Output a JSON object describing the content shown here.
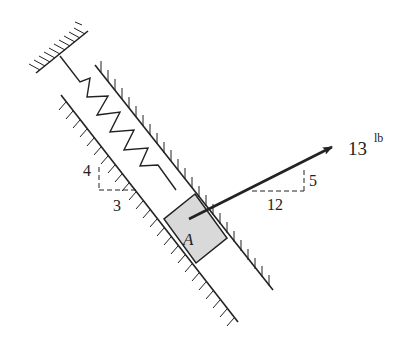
{
  "diagram": {
    "block_label": "A",
    "force": {
      "magnitude": "13",
      "unit": "lb"
    },
    "spring_slope": {
      "rise": "4",
      "run": "3"
    },
    "force_slope": {
      "rise": "5",
      "run": "12"
    }
  },
  "colors": {
    "ink": "#222222",
    "block_fill": "#d9d9d9",
    "background": "#ffffff"
  }
}
